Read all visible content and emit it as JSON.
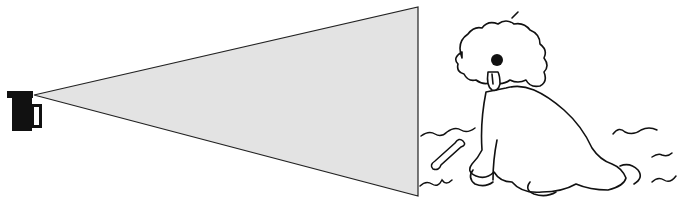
{
  "scene": {
    "description": "Line illustration of a camera projecting a field-of-view cone toward a shaggy dog sitting on grass beside a bone",
    "elements": [
      "camera-icon",
      "view-cone",
      "dog-illustration",
      "bone",
      "grass-strokes"
    ],
    "colors": {
      "background": "#ffffff",
      "cone_fill": "#e3e3e3",
      "ink": "#111111"
    }
  }
}
